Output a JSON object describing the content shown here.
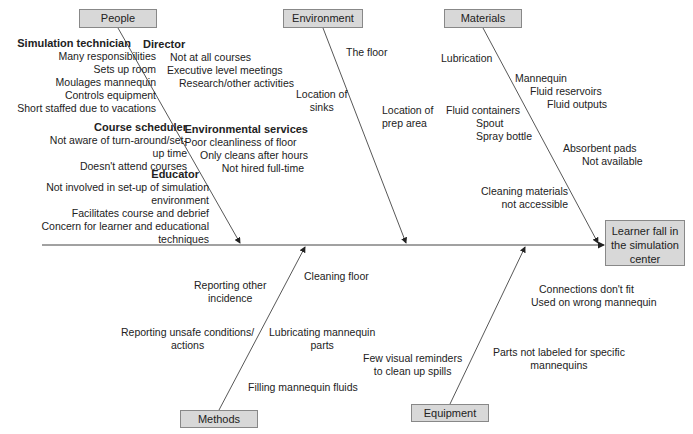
{
  "effect": "Learner fall in the simulation center",
  "effect_lines": [
    "Learner fall in",
    "the simulation",
    "center"
  ],
  "categories": {
    "people": {
      "label": "People",
      "groups": [
        {
          "heading": "Simulation technician",
          "items": [
            "Many responsibilities",
            "Sets up room",
            "Moulages mannequin",
            "Controls equipment",
            "Short staffed due to vacations"
          ]
        },
        {
          "heading": "Director",
          "items": [
            "Not at all courses",
            "Executive level meetings",
            "Research/other activities"
          ]
        },
        {
          "heading": "Course scheduler",
          "items": [
            "Not aware of turn-around/set-",
            "up time",
            "Doesn't attend courses"
          ]
        },
        {
          "heading": "Environmental services",
          "items": [
            "Poor cleanliness of floor",
            "Only cleans after hours",
            "Not hired full-time"
          ]
        },
        {
          "heading": "Educator",
          "items": [
            "Not involved in set-up of simulation",
            "environment",
            "Facilitates course and debrief",
            "Concern for learner and educational",
            "techniques"
          ]
        }
      ]
    },
    "environment": {
      "label": "Environment",
      "items": [
        "The floor",
        "Location of",
        "sinks",
        "Location of",
        "prep area"
      ]
    },
    "materials": {
      "label": "Materials",
      "items": [
        "Lubrication",
        "Mannequin",
        "Fluid reservoirs",
        "Fluid outputs",
        "Fluid containers",
        "Spout",
        "Spray bottle",
        "Absorbent pads",
        "Not available",
        "Cleaning materials",
        "not accessible"
      ]
    },
    "methods": {
      "label": "Methods",
      "items": [
        "Reporting other",
        "incidence",
        "Reporting unsafe conditions/",
        "actions",
        "Cleaning floor",
        "Lubricating mannequin",
        "parts",
        "Filling mannequin fluids"
      ]
    },
    "equipment": {
      "label": "Equipment",
      "items": [
        "Connections don't fit",
        "Used on wrong mannequin",
        "Few visual reminders",
        "to clean up spills",
        "Parts not labeled for specific",
        "mannequins"
      ]
    }
  }
}
